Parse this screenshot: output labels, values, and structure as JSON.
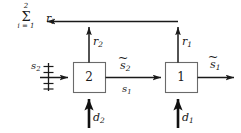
{
  "diagram": {
    "kind": "block-diagram",
    "colors": {
      "line": "#1a1a1a",
      "box_fill": "#ffffff",
      "box_stroke": "#555555",
      "text": "#1a1a1a",
      "background": "#ffffff"
    },
    "summation": {
      "upper_limit": "2",
      "sigma": "Σ",
      "lower_limit": "i = 1",
      "term": "r",
      "term_subscript": "i"
    },
    "blocks": [
      {
        "id": "block-2",
        "label": "2"
      },
      {
        "id": "block-1",
        "label": "1"
      }
    ],
    "signals": {
      "r2": {
        "base": "r",
        "sub": "2",
        "tilde": false
      },
      "r1": {
        "base": "r",
        "sub": "1",
        "tilde": false
      },
      "s2_in": {
        "base": "s",
        "sub": "2",
        "tilde": false
      },
      "s2_tilde": {
        "base": "s",
        "sub": "2",
        "tilde": true
      },
      "s1": {
        "base": "s",
        "sub": "1",
        "tilde": false
      },
      "s1_tilde": {
        "base": "s",
        "sub": "1",
        "tilde": true
      },
      "d2": {
        "base": "d",
        "sub": "2",
        "tilde": false
      },
      "d1": {
        "base": "d",
        "sub": "1",
        "tilde": false
      }
    },
    "bus_marker": {
      "name": "multi-line-bus-slashes",
      "tick_count": 4
    }
  }
}
